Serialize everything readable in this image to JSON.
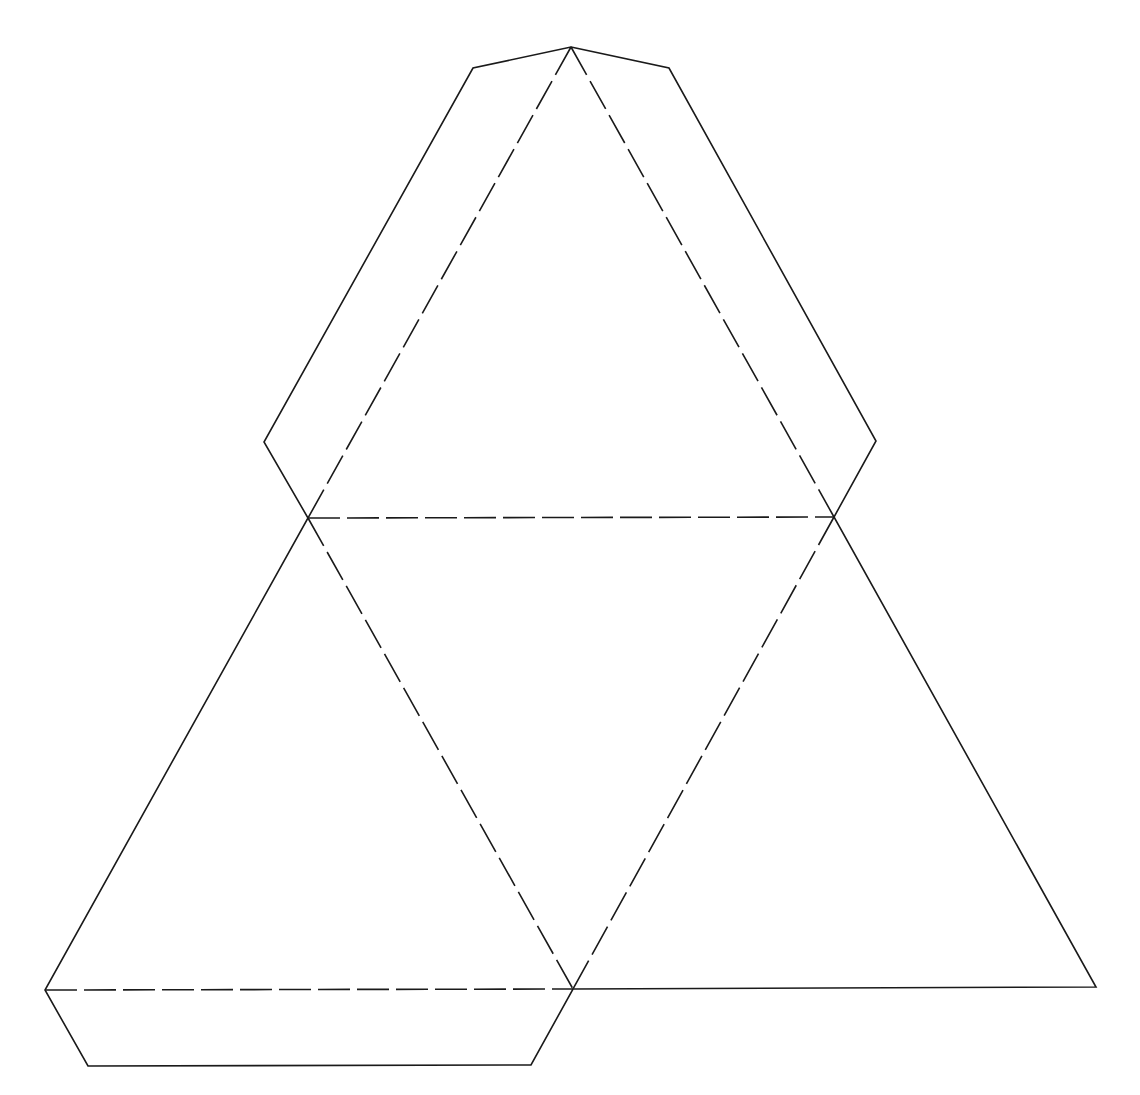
{
  "diagram": {
    "type": "net",
    "canvas": {
      "width": 1140,
      "height": 1095,
      "background": "#ffffff"
    },
    "stroke_color": "#1a1a1a",
    "fold_dash": "32 7",
    "vertices": {
      "top_apex": [
        571,
        47
      ],
      "mid_left": [
        308,
        518
      ],
      "mid_right": [
        834,
        517
      ],
      "bottom_left": [
        45,
        990
      ],
      "bottom_mid": [
        573,
        989
      ],
      "bottom_right": [
        1096,
        987
      ]
    },
    "tab_corners": {
      "top_left_shoulder": [
        473,
        68
      ],
      "top_right_shoulder": [
        669,
        68
      ],
      "left_flap": [
        264,
        442
      ],
      "right_flap": [
        876,
        441
      ],
      "bottom_flap_left": [
        88,
        1066
      ],
      "bottom_flap_right": [
        531,
        1065
      ]
    },
    "outline_points": [
      [
        571,
        47
      ],
      [
        669,
        68
      ],
      [
        876,
        441
      ],
      [
        834,
        517
      ],
      [
        1096,
        987
      ],
      [
        573,
        989
      ],
      [
        531,
        1065
      ],
      [
        88,
        1066
      ],
      [
        45,
        990
      ],
      [
        308,
        518
      ],
      [
        264,
        442
      ],
      [
        473,
        68
      ]
    ],
    "fold_lines": [
      {
        "name": "top-left-fold",
        "from": [
          571,
          47
        ],
        "to": [
          308,
          518
        ]
      },
      {
        "name": "top-right-fold",
        "from": [
          571,
          47
        ],
        "to": [
          834,
          517
        ]
      },
      {
        "name": "middle-horizontal-fold",
        "from": [
          308,
          518
        ],
        "to": [
          834,
          517
        ]
      },
      {
        "name": "center-left-fold",
        "from": [
          308,
          518
        ],
        "to": [
          573,
          989
        ]
      },
      {
        "name": "center-right-fold",
        "from": [
          834,
          517
        ],
        "to": [
          573,
          989
        ]
      },
      {
        "name": "bottom-tab-fold",
        "from": [
          45,
          990
        ],
        "to": [
          573,
          989
        ]
      }
    ],
    "faces": [
      {
        "name": "top-face",
        "points": [
          [
            571,
            47
          ],
          [
            308,
            518
          ],
          [
            834,
            517
          ]
        ]
      },
      {
        "name": "center-face",
        "points": [
          [
            308,
            518
          ],
          [
            834,
            517
          ],
          [
            573,
            989
          ]
        ]
      },
      {
        "name": "left-face",
        "points": [
          [
            308,
            518
          ],
          [
            45,
            990
          ],
          [
            573,
            989
          ]
        ]
      },
      {
        "name": "right-face",
        "points": [
          [
            834,
            517
          ],
          [
            573,
            989
          ],
          [
            1096,
            987
          ]
        ]
      }
    ],
    "tabs": [
      {
        "name": "top-left-tab",
        "points": [
          [
            571,
            47
          ],
          [
            473,
            68
          ],
          [
            264,
            442
          ],
          [
            308,
            518
          ]
        ]
      },
      {
        "name": "top-right-tab",
        "points": [
          [
            571,
            47
          ],
          [
            669,
            68
          ],
          [
            876,
            441
          ],
          [
            834,
            517
          ]
        ]
      },
      {
        "name": "bottom-tab",
        "points": [
          [
            45,
            990
          ],
          [
            88,
            1066
          ],
          [
            531,
            1065
          ],
          [
            573,
            989
          ]
        ]
      }
    ]
  }
}
